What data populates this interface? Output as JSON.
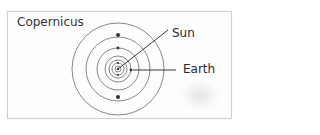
{
  "diagram": {
    "title": "Copernicus",
    "labels": {
      "sun": "Sun",
      "earth": "Earth"
    },
    "model": "heliocentric",
    "center": {
      "x": 118,
      "y": 69
    },
    "orbit_radii": [
      3,
      6,
      9,
      13,
      21,
      32,
      46
    ],
    "colors": {
      "orbit": "#555555",
      "planet": "#333333",
      "leader": "#222222",
      "text": "#2a2a2a"
    }
  }
}
